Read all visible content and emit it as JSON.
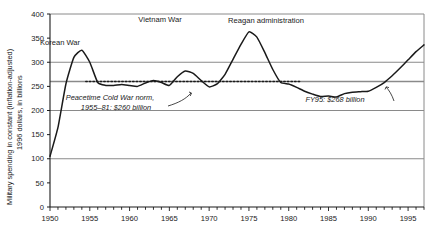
{
  "chart_data": {
    "type": "line",
    "title": "",
    "xlabel": "",
    "ylabel": "Military spending in constant (inflation-adjusted) 1996 dollars, in billions",
    "ylabel_line1": "Military spending in constant (inflation-adjusted)",
    "ylabel_line2": "1996 dollars, in billions",
    "xlim": [
      1950,
      1997
    ],
    "ylim": [
      0,
      400
    ],
    "ytick_labels": [
      "0",
      "50",
      "100",
      "150",
      "200",
      "250",
      "300",
      "350",
      "400"
    ],
    "yticks": [
      0,
      50,
      100,
      150,
      200,
      250,
      300,
      350,
      400
    ],
    "xtick_labels": [
      "1950",
      "1955",
      "1960",
      "1965",
      "1970",
      "1975",
      "1980",
      "1985",
      "1990",
      "1995"
    ],
    "xticks": [
      1950,
      1955,
      1960,
      1965,
      1970,
      1975,
      1980,
      1985,
      1990,
      1995
    ],
    "minor_xtick_interval": 1,
    "gridlines_y": [
      100,
      200,
      260,
      300,
      400
    ],
    "grid": true,
    "legend": "none",
    "series": [
      {
        "name": "Military spending",
        "x": [
          1950,
          1951,
          1952,
          1953,
          1954,
          1955,
          1956,
          1957,
          1958,
          1959,
          1960,
          1961,
          1962,
          1963,
          1964,
          1965,
          1966,
          1967,
          1968,
          1969,
          1970,
          1971,
          1972,
          1973,
          1974,
          1975,
          1976,
          1977,
          1978,
          1979,
          1980,
          1981,
          1982,
          1983,
          1984,
          1985,
          1986,
          1987,
          1988,
          1989,
          1990,
          1991,
          1992,
          1993,
          1994,
          1995,
          1996,
          1997
        ],
        "values": [
          105,
          165,
          255,
          310,
          325,
          300,
          258,
          252,
          252,
          254,
          252,
          250,
          257,
          262,
          258,
          252,
          270,
          282,
          277,
          262,
          249,
          255,
          275,
          306,
          337,
          363,
          352,
          320,
          285,
          258,
          255,
          248,
          240,
          234,
          229,
          230,
          228,
          235,
          238,
          239,
          240,
          248,
          258,
          272,
          288,
          305,
          322,
          336
        ]
      }
    ],
    "reference_line": {
      "label": "Peacetime Cold War norm, 1955-81: $260 billion",
      "value": 260,
      "x_start": 1954.5,
      "x_end": 1981.5,
      "style": "dotted"
    },
    "annotations": [
      {
        "key": "korean-war",
        "text": "Korean War",
        "x_px": 60,
        "y_px": 45
      },
      {
        "key": "vietnam-war",
        "text": "Vietnam War",
        "x_px": 160,
        "y_px": 22
      },
      {
        "key": "reagan-administration",
        "text": "Reagan administration",
        "x_px": 266,
        "y_px": 23
      },
      {
        "key": "peacetime-norm-line1",
        "text": "Peacetime Cold War norm,",
        "x_px": 110,
        "y_px": 100
      },
      {
        "key": "peacetime-norm-line2",
        "text": "1955–81: $260 billion",
        "x_px": 116,
        "y_px": 110
      },
      {
        "key": "fy95-value",
        "text": "FY95: $268 billion",
        "x_px": 335,
        "y_px": 102
      }
    ],
    "colors": {
      "line": "#1a1a1a",
      "grid": "#8a8a8a",
      "axis": "#1a1a1a",
      "background": "#ffffff",
      "text": "#1a1a1a"
    }
  }
}
